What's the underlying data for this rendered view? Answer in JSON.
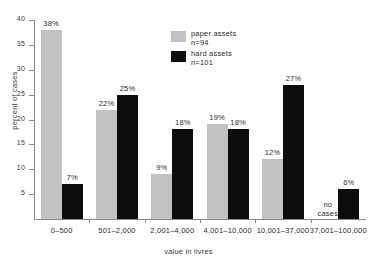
{
  "chart_data": {
    "type": "bar",
    "title": "",
    "subtitle": "",
    "xlabel": "value in livres",
    "ylabel": "percent of cases",
    "ylim": [
      0,
      40
    ],
    "yticks": [
      0,
      5,
      10,
      15,
      20,
      25,
      30,
      35,
      40
    ],
    "ytick_labels": [
      "",
      "5",
      "10",
      "15",
      "20",
      "25",
      "30",
      "35",
      "40"
    ],
    "grid": false,
    "legend_position": "top-center",
    "categories": [
      "0–500",
      "501–2,000",
      "2,001–4,000",
      "4,001–10,000",
      "10,001–37,000",
      "37,001–100,000"
    ],
    "series": [
      {
        "name": "paper assets",
        "n_label": "n=94",
        "color": "#c2c2c2",
        "values": [
          38,
          22,
          9,
          19,
          12,
          null
        ],
        "value_labels": [
          "38%",
          "22%",
          "9%",
          "19%",
          "12%",
          "no cases"
        ]
      },
      {
        "name": "hard assets",
        "n_label": "n=101",
        "color": "#0d0d0d",
        "values": [
          7,
          25,
          18,
          18,
          27,
          6
        ],
        "value_labels": [
          "7%",
          "25%",
          "18%",
          "18%",
          "27%",
          "6%"
        ]
      }
    ],
    "annotations": [
      {
        "text": "no cases",
        "category": "37,001–100,000",
        "series": "paper assets"
      }
    ]
  },
  "legend": {
    "items": [
      {
        "label": "paper assets",
        "sub": "n=94",
        "swatch": "paper"
      },
      {
        "label": "hard assets",
        "sub": "n=101",
        "swatch": "hard"
      }
    ]
  },
  "no_cases": {
    "line1": "no",
    "line2": "cases"
  }
}
